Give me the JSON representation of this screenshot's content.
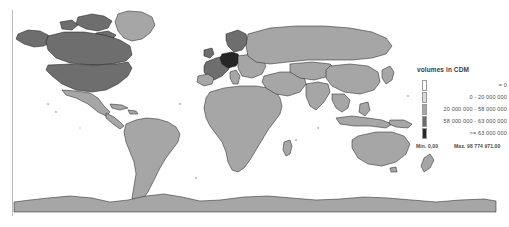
{
  "map": {
    "projection_name": "world-choropleth",
    "ocean_color": "#ffffff",
    "default_land_color": "#a6a6a6",
    "border_color": "#1a1a1a",
    "frame_rule_color": "#bdbdbd",
    "regions": [
      {
        "name": "canada",
        "class_index": 3
      },
      {
        "name": "united-states",
        "class_index": 3
      },
      {
        "name": "mexico",
        "class_index": 1
      },
      {
        "name": "greenland",
        "class_index": 1
      },
      {
        "name": "brazil",
        "class_index": 1
      },
      {
        "name": "argentina",
        "class_index": 1
      },
      {
        "name": "germany",
        "class_index": 4
      },
      {
        "name": "france",
        "class_index": 2
      },
      {
        "name": "united-kingdom",
        "class_index": 2
      },
      {
        "name": "russia",
        "class_index": 2
      },
      {
        "name": "china",
        "class_index": 2
      },
      {
        "name": "india",
        "class_index": 1
      },
      {
        "name": "australia",
        "class_index": 1
      },
      {
        "name": "antarctica",
        "class_index": 1
      }
    ]
  },
  "legend": {
    "title": "volumes in CDM",
    "classes": [
      {
        "swatch": "#ffffff",
        "label": "=                 0"
      },
      {
        "swatch": "#d9d9d9",
        "label": "0 -  20 000 000"
      },
      {
        "swatch": "#a6a6a6",
        "label": "20 000 000  -  58 000 000"
      },
      {
        "swatch": "#6e6e6e",
        "label": "58 000 000  -  63 000 000"
      },
      {
        "swatch": "#262626",
        "label": ">=  63 000 000"
      }
    ],
    "stats": {
      "min": "Min. 0,00",
      "max": "Max. 98 774 971,00"
    }
  }
}
